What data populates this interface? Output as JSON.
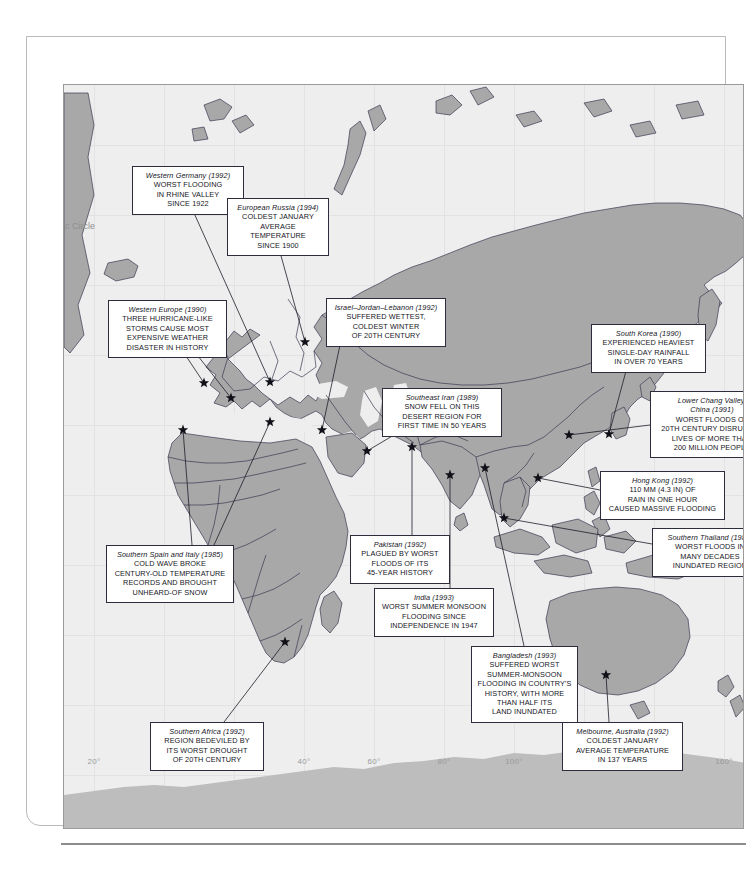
{
  "map": {
    "arctic_circle_label": "c Circle",
    "longitude_labels": [
      {
        "text": "20°",
        "x": 30
      },
      {
        "text": "0°",
        "x": 100
      },
      {
        "text": "20°",
        "x": 170
      },
      {
        "text": "40°",
        "x": 240
      },
      {
        "text": "60°",
        "x": 310
      },
      {
        "text": "80°",
        "x": 380
      },
      {
        "text": "100°",
        "x": 450
      },
      {
        "text": "120°",
        "x": 520
      },
      {
        "text": "140°",
        "x": 590
      },
      {
        "text": "160°",
        "x": 660
      }
    ],
    "colors": {
      "ocean": "#eeeeee",
      "land": "#a8a8a8",
      "antarctica": "#bdbdbd",
      "coastline": "#3a3a52",
      "callout_border": "#2c2c3c",
      "marker": "#101018",
      "graticule": "#e2e2e2"
    }
  },
  "callouts": [
    {
      "id": "western-germany",
      "title": "Western Germany (1992)",
      "body": "WORST FLOODING\nIN RHINE VALLEY\nSINCE 1922",
      "x": 68,
      "y": 81,
      "w": 112,
      "h": 47
    },
    {
      "id": "european-russia",
      "title": "European Russia (1994)",
      "body": "COLDEST JANUARY\nAVERAGE TEMPERATURE\nSINCE 1900",
      "x": 163,
      "y": 113,
      "w": 102,
      "h": 47
    },
    {
      "id": "western-europe",
      "title": "Western Europe (1990)",
      "body": "THREE HURRICANE-LIKE\nSTORMS CAUSE MOST\nEXPENSIVE WEATHER\nDISASTER IN HISTORY",
      "x": 44,
      "y": 215,
      "w": 119,
      "h": 56
    },
    {
      "id": "israel-jordan-lebanon",
      "title": "Israel–Jordan–Lebanon (1992)",
      "body": "SUFFERED WETTEST,\nCOLDEST WINTER\nOF 20TH CENTURY",
      "x": 262,
      "y": 213,
      "w": 120,
      "h": 47
    },
    {
      "id": "south-korea",
      "title": "South Korea (1990)",
      "body": "EXPERIENCED HEAVIEST\nSINGLE-DAY RAINFALL\nIN OVER 70 YEARS",
      "x": 527,
      "y": 239,
      "w": 115,
      "h": 47
    },
    {
      "id": "southeast-iran",
      "title": "Southeast Iran (1989)",
      "body": "SNOW FELL ON THIS\nDESERT REGION FOR\nFIRST TIME IN 50 YEARS",
      "x": 318,
      "y": 303,
      "w": 120,
      "h": 47
    },
    {
      "id": "lower-chang-valley-china",
      "title": "Lower Chang Valley,\nChina (1991)",
      "body": "WORST FLOODS OF\n20TH CENTURY DISRUPTED\nLIVES OF MORE THAN\n200 MILLION PEOPLE",
      "x": 586,
      "y": 306,
      "w": 124,
      "h": 65
    },
    {
      "id": "hong-kong",
      "title": "Hong Kong (1992)",
      "body": "110 MM (4.3 IN) OF\nRAIN IN ONE HOUR\nCAUSED MASSIVE FLOODING",
      "x": 536,
      "y": 386,
      "w": 125,
      "h": 47
    },
    {
      "id": "southern-spain-italy",
      "title": "Southern Spain and Italy (1985)",
      "body": "COLD WAVE BROKE\nCENTURY-OLD TEMPERATURE\nRECORDS AND BROUGHT\nUNHEARD-OF SNOW",
      "x": 42,
      "y": 460,
      "w": 128,
      "h": 56
    },
    {
      "id": "pakistan",
      "title": "Pakistan (1992)",
      "body": "PLAGUED BY WORST\nFLOODS OF ITS\n45-YEAR HISTORY",
      "x": 286,
      "y": 450,
      "w": 100,
      "h": 47
    },
    {
      "id": "southern-thailand",
      "title": "Southern Thailand (1988)",
      "body": "WORST FLOODS IN\nMANY DECADES\nINUNDATED REGION",
      "x": 588,
      "y": 443,
      "w": 116,
      "h": 47
    },
    {
      "id": "india",
      "title": "India (1993)",
      "body": "WORST SUMMER MONSOON\nFLOODING SINCE\nINDEPENDENCE IN 1947",
      "x": 310,
      "y": 503,
      "w": 120,
      "h": 47
    },
    {
      "id": "bangladesh",
      "title": "Bangladesh (1993)",
      "body": "SUFFERED WORST\nSUMMER-MONSOON\nFLOODING IN COUNTRY'S\nHISTORY, WITH MORE\nTHAN HALF ITS\nLAND INUNDATED",
      "x": 407,
      "y": 561,
      "w": 107,
      "h": 74
    },
    {
      "id": "southern-africa",
      "title": "Southern Africa (1992)",
      "body": "REGION BEDEVILED BY\nITS WORST DROUGHT\nOF 20TH CENTURY",
      "x": 86,
      "y": 637,
      "w": 114,
      "h": 47
    },
    {
      "id": "melbourne-australia",
      "title": "Melbourne, Australia (1992)",
      "body": "COLDEST JANUARY\nAVERAGE TEMPERATURE\nIN 137 YEARS",
      "x": 498,
      "y": 637,
      "w": 121,
      "h": 47
    }
  ],
  "markers": [
    {
      "id": "marker-western-europe-1",
      "x": 140,
      "y": 298
    },
    {
      "id": "marker-western-europe-2",
      "x": 167,
      "y": 313
    },
    {
      "id": "marker-western-germany",
      "x": 206,
      "y": 297
    },
    {
      "id": "marker-european-russia",
      "x": 241,
      "y": 257
    },
    {
      "id": "marker-southern-spain",
      "x": 119,
      "y": 345
    },
    {
      "id": "marker-southern-italy",
      "x": 206,
      "y": 337
    },
    {
      "id": "marker-israel-jordan-lebanon",
      "x": 258,
      "y": 345
    },
    {
      "id": "marker-southeast-iran",
      "x": 303,
      "y": 366
    },
    {
      "id": "marker-pakistan",
      "x": 348,
      "y": 362
    },
    {
      "id": "marker-india",
      "x": 386,
      "y": 390
    },
    {
      "id": "marker-bangladesh",
      "x": 421,
      "y": 383
    },
    {
      "id": "marker-southern-thailand",
      "x": 440,
      "y": 433
    },
    {
      "id": "marker-hong-kong",
      "x": 474,
      "y": 393
    },
    {
      "id": "marker-lower-chang-valley",
      "x": 505,
      "y": 350
    },
    {
      "id": "marker-south-korea",
      "x": 545,
      "y": 349
    },
    {
      "id": "marker-southern-africa",
      "x": 221,
      "y": 557
    },
    {
      "id": "marker-melbourne",
      "x": 542,
      "y": 590
    }
  ],
  "leaders": [
    {
      "id": "leader-western-germany",
      "x1": 130,
      "y1": 128,
      "x2": 206,
      "y2": 297
    },
    {
      "id": "leader-european-russia",
      "x1": 214,
      "y1": 160,
      "x2": 241,
      "y2": 257
    },
    {
      "id": "leader-western-europe-a",
      "x1": 122,
      "y1": 271,
      "x2": 140,
      "y2": 298
    },
    {
      "id": "leader-western-europe-b",
      "x1": 134,
      "y1": 271,
      "x2": 167,
      "y2": 313
    },
    {
      "id": "leader-israel",
      "x1": 276,
      "y1": 260,
      "x2": 258,
      "y2": 345
    },
    {
      "id": "leader-south-korea",
      "x1": 562,
      "y1": 286,
      "x2": 545,
      "y2": 349
    },
    {
      "id": "leader-southeast-iran",
      "x1": 330,
      "y1": 350,
      "x2": 303,
      "y2": 366
    },
    {
      "id": "leader-chang-valley",
      "x1": 586,
      "y1": 340,
      "x2": 505,
      "y2": 350
    },
    {
      "id": "leader-hong-kong",
      "x1": 536,
      "y1": 405,
      "x2": 474,
      "y2": 393
    },
    {
      "id": "leader-southern-thailand",
      "x1": 588,
      "y1": 459,
      "x2": 440,
      "y2": 433
    },
    {
      "id": "leader-southern-spain",
      "x1": 128,
      "y1": 460,
      "x2": 119,
      "y2": 345
    },
    {
      "id": "leader-southern-italy",
      "x1": 150,
      "y1": 460,
      "x2": 206,
      "y2": 337
    },
    {
      "id": "leader-pakistan",
      "x1": 348,
      "y1": 450,
      "x2": 348,
      "y2": 362
    },
    {
      "id": "leader-india",
      "x1": 386,
      "y1": 503,
      "x2": 386,
      "y2": 390
    },
    {
      "id": "leader-bangladesh",
      "x1": 460,
      "y1": 561,
      "x2": 421,
      "y2": 383
    },
    {
      "id": "leader-southern-africa",
      "x1": 160,
      "y1": 637,
      "x2": 221,
      "y2": 557
    },
    {
      "id": "leader-melbourne",
      "x1": 545,
      "y1": 637,
      "x2": 542,
      "y2": 590
    }
  ]
}
